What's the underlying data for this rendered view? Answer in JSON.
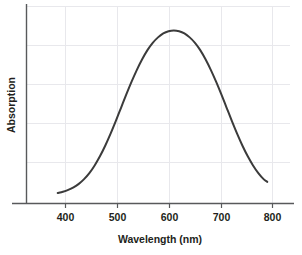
{
  "chart_data": {
    "type": "line",
    "title": "",
    "xlabel": "Wavelength (nm)",
    "ylabel": "Absorption",
    "xlim": [
      340,
      840
    ],
    "ylim": [
      0,
      1.08
    ],
    "xticks": [
      400,
      500,
      600,
      700,
      800
    ],
    "xtick_labels": [
      "400",
      "500",
      "600",
      "700",
      "800"
    ],
    "yticks": [],
    "ytick_labels": [],
    "grid": true,
    "grid_color": "#e8e8ec",
    "legend": null,
    "legend_position": "none",
    "series": [
      {
        "name": "Absorption spectrum",
        "color": "#3b3b3b",
        "line_width": 2,
        "x": [
          400,
          410,
          420,
          430,
          440,
          450,
          460,
          470,
          480,
          490,
          500,
          510,
          520,
          530,
          540,
          550,
          560,
          570,
          580,
          590,
          600,
          610,
          620,
          630,
          640,
          650,
          660,
          670,
          680,
          690,
          700,
          710,
          720,
          730,
          740,
          750,
          760,
          770,
          780,
          790,
          797
        ],
        "y": [
          0.055,
          0.062,
          0.072,
          0.086,
          0.105,
          0.131,
          0.164,
          0.206,
          0.256,
          0.314,
          0.379,
          0.449,
          0.522,
          0.595,
          0.665,
          0.73,
          0.788,
          0.838,
          0.878,
          0.908,
          0.93,
          0.942,
          0.946,
          0.942,
          0.93,
          0.908,
          0.878,
          0.838,
          0.788,
          0.73,
          0.665,
          0.595,
          0.522,
          0.449,
          0.379,
          0.314,
          0.256,
          0.206,
          0.164,
          0.131,
          0.116
        ]
      }
    ],
    "peak": {
      "x": 620,
      "y": 0.946
    },
    "annotations": []
  },
  "axes": {
    "x_tick_400": "400",
    "x_tick_500": "500",
    "x_tick_600": "600",
    "x_tick_700": "700",
    "x_tick_800": "800",
    "x_axis_title": "Wavelength (nm)",
    "y_axis_title": "Absorption"
  },
  "colors": {
    "curve": "#3b3b3b",
    "spine": "#58595b",
    "grid": "#e8e8ec",
    "text": "#231f20",
    "background": "#ffffff"
  }
}
